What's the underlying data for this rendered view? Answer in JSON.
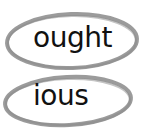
{
  "worksheet": {
    "items": [
      {
        "text": "ought",
        "circled": true
      },
      {
        "text": "ious",
        "circled": true
      }
    ],
    "colors": {
      "oval_stroke": "#8a8a8a",
      "text": "#111111",
      "background": "#ffffff"
    }
  }
}
